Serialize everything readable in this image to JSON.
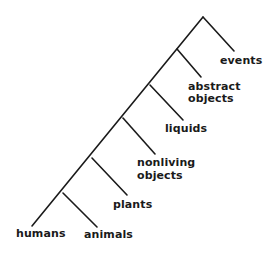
{
  "diagram": {
    "type": "binary-branching-tree",
    "line_color": "#1a1a1a",
    "text_color": "#1a1a1a",
    "leaves": [
      {
        "id": "events",
        "lines": [
          "events"
        ]
      },
      {
        "id": "abstract-objects",
        "lines": [
          "abstract",
          "objects"
        ]
      },
      {
        "id": "liquids",
        "lines": [
          "liquids"
        ]
      },
      {
        "id": "nonliving-objects",
        "lines": [
          "nonliving",
          "objects"
        ]
      },
      {
        "id": "plants",
        "lines": [
          "plants"
        ]
      },
      {
        "id": "animals",
        "lines": [
          "animals"
        ]
      },
      {
        "id": "humans",
        "lines": [
          "humans"
        ]
      }
    ]
  }
}
